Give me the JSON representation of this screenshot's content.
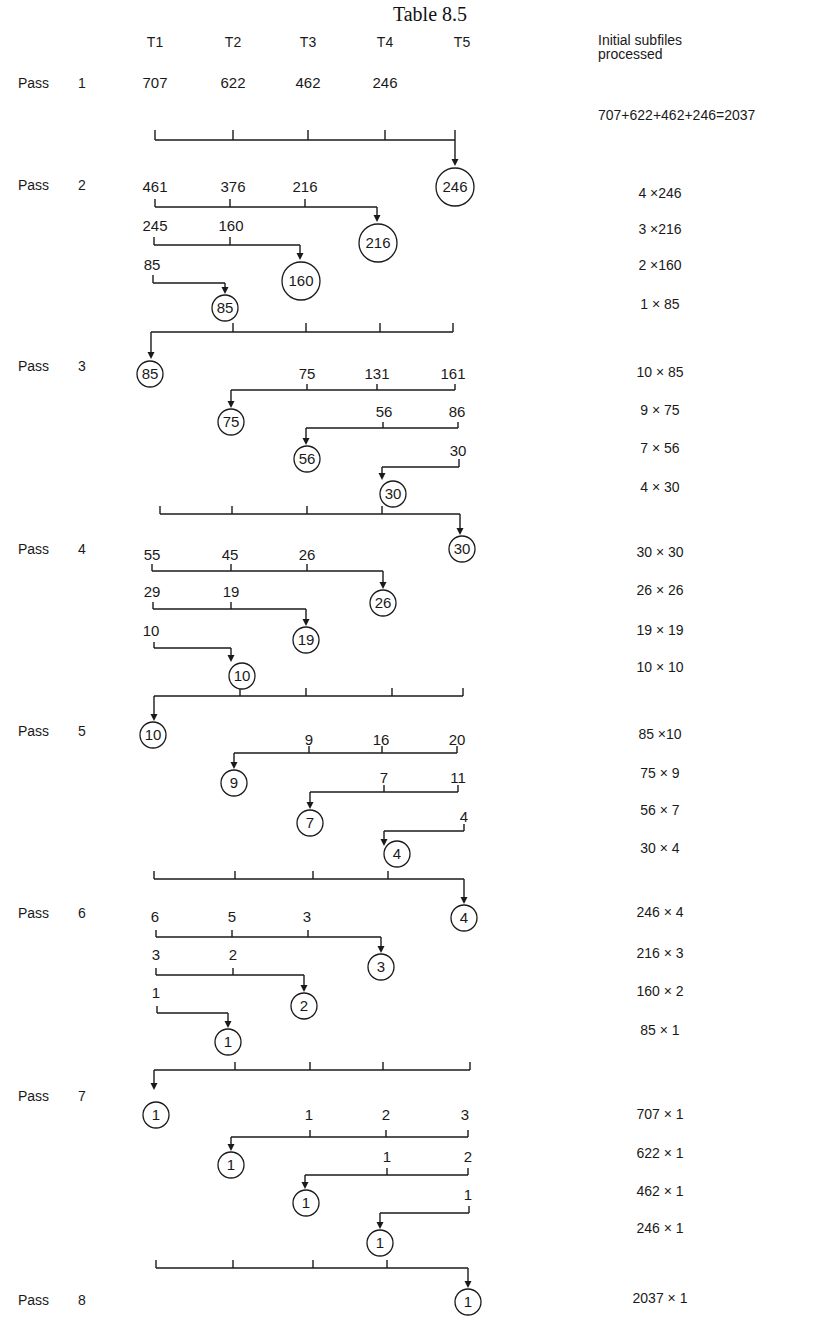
{
  "title": "Table 8.5",
  "cropped_top_text": "…",
  "columns": [
    "T1",
    "T2",
    "T3",
    "T4",
    "T5"
  ],
  "right_header": [
    "Initial subfiles",
    "processed"
  ],
  "passes": [
    {
      "label": "Pass",
      "number": "1",
      "y": 88
    },
    {
      "label": "Pass",
      "number": "2",
      "y": 190
    },
    {
      "label": "Pass",
      "number": "3",
      "y": 371
    },
    {
      "label": "Pass",
      "number": "4",
      "y": 554
    },
    {
      "label": "Pass",
      "number": "5",
      "y": 736
    },
    {
      "label": "Pass",
      "number": "6",
      "y": 918
    },
    {
      "label": "Pass",
      "number": "7",
      "y": 1101
    },
    {
      "label": "Pass",
      "number": "8",
      "y": 1305
    }
  ],
  "processed": [
    {
      "text": "707+622+462+246=2037",
      "y": 120
    },
    {
      "text": "4 ×246",
      "y": 198
    },
    {
      "text": "3 ×216",
      "y": 234
    },
    {
      "text": "2 ×160",
      "y": 270
    },
    {
      "text": "1 × 85",
      "y": 309
    },
    {
      "text": "10 × 85",
      "y": 377
    },
    {
      "text": "9 × 75",
      "y": 415
    },
    {
      "text": "7 × 56",
      "y": 453
    },
    {
      "text": "4 × 30",
      "y": 492
    },
    {
      "text": "30 × 30",
      "y": 557
    },
    {
      "text": "26 × 26",
      "y": 595
    },
    {
      "text": "19 × 19",
      "y": 635
    },
    {
      "text": "10 × 10",
      "y": 672
    },
    {
      "text": "85 ×10",
      "y": 739
    },
    {
      "text": "75 × 9",
      "y": 778
    },
    {
      "text": "56 × 7",
      "y": 815
    },
    {
      "text": "30 × 4",
      "y": 853
    },
    {
      "text": "246 × 4",
      "y": 917
    },
    {
      "text": "216 × 3",
      "y": 958
    },
    {
      "text": "160 × 2",
      "y": 996
    },
    {
      "text": "85 × 1",
      "y": 1035
    },
    {
      "text": "707 × 1",
      "y": 1119
    },
    {
      "text": "622 × 1",
      "y": 1158
    },
    {
      "text": "462 × 1",
      "y": 1196
    },
    {
      "text": "246 × 1",
      "y": 1233
    },
    {
      "text": "2037 × 1",
      "y": 1303
    }
  ],
  "numbers": [
    {
      "t": "707",
      "x": 155,
      "y": 88
    },
    {
      "t": "622",
      "x": 233,
      "y": 88
    },
    {
      "t": "462",
      "x": 308,
      "y": 88
    },
    {
      "t": "246",
      "x": 385,
      "y": 88
    },
    {
      "t": "461",
      "x": 155,
      "y": 192
    },
    {
      "t": "376",
      "x": 233,
      "y": 192
    },
    {
      "t": "216",
      "x": 305,
      "y": 192
    },
    {
      "t": "245",
      "x": 155,
      "y": 231
    },
    {
      "t": "160",
      "x": 231,
      "y": 231
    },
    {
      "t": "85",
      "x": 152,
      "y": 270
    },
    {
      "t": "75",
      "x": 307,
      "y": 379
    },
    {
      "t": "131",
      "x": 377,
      "y": 379
    },
    {
      "t": "161",
      "x": 453,
      "y": 379
    },
    {
      "t": "56",
      "x": 384,
      "y": 417
    },
    {
      "t": "86",
      "x": 457,
      "y": 417
    },
    {
      "t": "30",
      "x": 458,
      "y": 456
    },
    {
      "t": "55",
      "x": 152,
      "y": 560
    },
    {
      "t": "45",
      "x": 230,
      "y": 560
    },
    {
      "t": "26",
      "x": 307,
      "y": 560
    },
    {
      "t": "29",
      "x": 152,
      "y": 597
    },
    {
      "t": "19",
      "x": 231,
      "y": 597
    },
    {
      "t": "10",
      "x": 151,
      "y": 636
    },
    {
      "t": "9",
      "x": 309,
      "y": 745
    },
    {
      "t": "16",
      "x": 381,
      "y": 745
    },
    {
      "t": "20",
      "x": 457,
      "y": 745
    },
    {
      "t": "7",
      "x": 384,
      "y": 783
    },
    {
      "t": "11",
      "x": 458,
      "y": 783
    },
    {
      "t": "4",
      "x": 464,
      "y": 822
    },
    {
      "t": "6",
      "x": 155,
      "y": 922
    },
    {
      "t": "5",
      "x": 232,
      "y": 922
    },
    {
      "t": "3",
      "x": 307,
      "y": 922
    },
    {
      "t": "3",
      "x": 156,
      "y": 960
    },
    {
      "t": "2",
      "x": 233,
      "y": 960
    },
    {
      "t": "1",
      "x": 156,
      "y": 998
    },
    {
      "t": "1",
      "x": 309,
      "y": 1120
    },
    {
      "t": "2",
      "x": 386,
      "y": 1120
    },
    {
      "t": "3",
      "x": 465,
      "y": 1120
    },
    {
      "t": "1",
      "x": 387,
      "y": 1162
    },
    {
      "t": "2",
      "x": 468,
      "y": 1162
    },
    {
      "t": "1",
      "x": 468,
      "y": 1200
    }
  ],
  "circles": [
    {
      "t": "246",
      "cx": 455,
      "cy": 187,
      "r": 19
    },
    {
      "t": "216",
      "cx": 378,
      "cy": 243,
      "r": 19
    },
    {
      "t": "160",
      "cx": 301,
      "cy": 281,
      "r": 19
    },
    {
      "t": "85",
      "cx": 225,
      "cy": 308,
      "r": 13
    },
    {
      "t": "85",
      "cx": 150,
      "cy": 374,
      "r": 13
    },
    {
      "t": "75",
      "cx": 231,
      "cy": 422,
      "r": 13
    },
    {
      "t": "56",
      "cx": 307,
      "cy": 459,
      "r": 13
    },
    {
      "t": "30",
      "cx": 393,
      "cy": 494,
      "r": 13
    },
    {
      "t": "30",
      "cx": 462,
      "cy": 549,
      "r": 13
    },
    {
      "t": "26",
      "cx": 383,
      "cy": 603,
      "r": 13
    },
    {
      "t": "19",
      "cx": 306,
      "cy": 640,
      "r": 13
    },
    {
      "t": "10",
      "cx": 242,
      "cy": 676,
      "r": 13
    },
    {
      "t": "10",
      "cx": 153,
      "cy": 735,
      "r": 13
    },
    {
      "t": "9",
      "cx": 234,
      "cy": 783,
      "r": 13
    },
    {
      "t": "7",
      "cx": 310,
      "cy": 823,
      "r": 13
    },
    {
      "t": "4",
      "cx": 397,
      "cy": 854,
      "r": 13
    },
    {
      "t": "4",
      "cx": 464,
      "cy": 918,
      "r": 13
    },
    {
      "t": "3",
      "cx": 381,
      "cy": 967,
      "r": 13
    },
    {
      "t": "2",
      "cx": 304,
      "cy": 1006,
      "r": 13
    },
    {
      "t": "1",
      "cx": 228,
      "cy": 1042,
      "r": 13
    },
    {
      "t": "1",
      "cx": 156,
      "cy": 1115,
      "r": 13
    },
    {
      "t": "1",
      "cx": 231,
      "cy": 1165,
      "r": 13
    },
    {
      "t": "1",
      "cx": 306,
      "cy": 1203,
      "r": 13
    },
    {
      "t": "1",
      "cx": 380,
      "cy": 1243,
      "r": 13
    },
    {
      "t": "1",
      "cx": 468,
      "cy": 1302,
      "r": 13
    }
  ],
  "connectors": [
    {
      "y": 140,
      "x1": 155,
      "x2": 455,
      "ticks": [
        155,
        233,
        308,
        385,
        455
      ],
      "tickUp": 10,
      "arrowX": 455,
      "arrowTo": 166,
      "leftUp": true
    },
    {
      "y": 207,
      "x1": 155,
      "x2": 377,
      "ticks": [
        155,
        230,
        305
      ],
      "tickUp": 8,
      "arrowX": 377,
      "arrowTo": 222
    },
    {
      "y": 245,
      "x1": 154,
      "x2": 300,
      "ticks": [
        154,
        230
      ],
      "tickUp": 8,
      "arrowX": 300,
      "arrowTo": 260
    },
    {
      "y": 283,
      "x1": 153,
      "x2": 225,
      "ticks": [
        153
      ],
      "tickUp": 8,
      "arrowX": 225,
      "arrowTo": 294
    },
    {
      "y": 332,
      "x1": 151,
      "x2": 453,
      "ticks": [
        233,
        306,
        380,
        453
      ],
      "tickUp": 9,
      "arrowX": 151,
      "arrowTo": 359
    },
    {
      "y": 390,
      "x1": 231,
      "x2": 455,
      "ticks": [
        307,
        377,
        455
      ],
      "tickUp": 6,
      "arrowX": 231,
      "arrowTo": 408
    },
    {
      "y": 428,
      "x1": 306,
      "x2": 458,
      "ticks": [
        383,
        458
      ],
      "tickUp": 6,
      "arrowX": 306,
      "arrowTo": 445
    },
    {
      "y": 467,
      "x1": 382,
      "x2": 459,
      "ticks": [
        459
      ],
      "tickUp": 8,
      "arrowX": 382,
      "arrowTo": 480
    },
    {
      "y": 514,
      "x1": 160,
      "x2": 460,
      "ticks": [
        160,
        232,
        307,
        382
      ],
      "tickUp": 8,
      "arrowX": 460,
      "arrowTo": 535
    },
    {
      "y": 571,
      "x1": 152,
      "x2": 383,
      "ticks": [
        152,
        231,
        307
      ],
      "tickUp": 7,
      "arrowX": 383,
      "arrowTo": 589
    },
    {
      "y": 609,
      "x1": 153,
      "x2": 306,
      "ticks": [
        153,
        231
      ],
      "tickUp": 7,
      "arrowX": 306,
      "arrowTo": 626
    },
    {
      "y": 648,
      "x1": 154,
      "x2": 231,
      "ticks": [
        154
      ],
      "tickUp": 6,
      "arrowX": 231,
      "arrowTo": 662
    },
    {
      "y": 696,
      "x1": 154,
      "x2": 463,
      "ticks": [
        240,
        306,
        392,
        463
      ],
      "tickUp": 8,
      "arrowX": 154,
      "arrowTo": 721
    },
    {
      "y": 753,
      "x1": 234,
      "x2": 457,
      "ticks": [
        309,
        382,
        457
      ],
      "tickUp": 7,
      "arrowX": 234,
      "arrowTo": 769
    },
    {
      "y": 792,
      "x1": 310,
      "x2": 458,
      "ticks": [
        384,
        458
      ],
      "tickUp": 7,
      "arrowX": 310,
      "arrowTo": 809
    },
    {
      "y": 831,
      "x1": 384,
      "x2": 464,
      "ticks": [
        464
      ],
      "tickUp": 7,
      "arrowX": 384,
      "arrowTo": 846
    },
    {
      "y": 879,
      "x1": 154,
      "x2": 464,
      "ticks": [
        154,
        235,
        313,
        388
      ],
      "tickUp": 8,
      "arrowX": 464,
      "arrowTo": 904
    },
    {
      "y": 937,
      "x1": 156,
      "x2": 381,
      "ticks": [
        156,
        232,
        308
      ],
      "tickUp": 7,
      "arrowX": 381,
      "arrowTo": 953
    },
    {
      "y": 975,
      "x1": 156,
      "x2": 304,
      "ticks": [
        156,
        233
      ],
      "tickUp": 7,
      "arrowX": 304,
      "arrowTo": 992
    },
    {
      "y": 1013,
      "x1": 157,
      "x2": 228,
      "ticks": [
        157
      ],
      "tickUp": 7,
      "arrowX": 228,
      "arrowTo": 1028
    },
    {
      "y": 1070,
      "x1": 154,
      "x2": 470,
      "ticks": [
        235,
        310,
        383,
        470
      ],
      "tickUp": 8,
      "arrowX": 154,
      "arrowTo": 1090
    },
    {
      "y": 1137,
      "x1": 231,
      "x2": 468,
      "ticks": [
        310,
        386,
        468
      ],
      "tickUp": 7,
      "arrowX": 231,
      "arrowTo": 1151
    },
    {
      "y": 1175,
      "x1": 305,
      "x2": 468,
      "ticks": [
        387,
        468
      ],
      "tickUp": 7,
      "arrowX": 305,
      "arrowTo": 1189
    },
    {
      "y": 1213,
      "x1": 380,
      "x2": 469,
      "ticks": [
        469
      ],
      "tickUp": 7,
      "arrowX": 380,
      "arrowTo": 1229
    },
    {
      "y": 1268,
      "x1": 156,
      "x2": 468,
      "ticks": [
        156,
        233,
        313,
        387
      ],
      "tickUp": 8,
      "arrowX": 468,
      "arrowTo": 1288
    }
  ]
}
